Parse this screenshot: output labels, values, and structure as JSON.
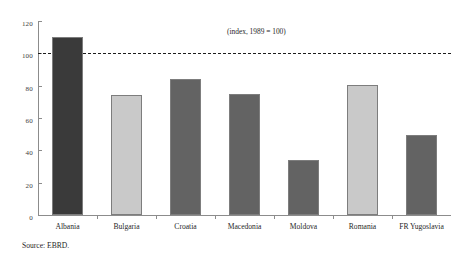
{
  "chart_data": {
    "type": "bar",
    "title": "",
    "subtitle": "",
    "annotation": "(index, 1989 = 100)",
    "xlabel": "",
    "ylabel": "",
    "ylim": [
      0,
      120
    ],
    "yticks": [
      0,
      20,
      40,
      60,
      80,
      100,
      120
    ],
    "grid": false,
    "legend": "none",
    "reference_line": {
      "value": 100,
      "style": "dashed",
      "color": "#1c1c1c"
    },
    "categories": [
      "Albania",
      "Bulgaria",
      "Croatia",
      "Macedonia",
      "Moldova",
      "Romania",
      "FR Yugoslavia"
    ],
    "values": [
      110,
      74,
      84,
      75,
      34,
      80.5,
      49.5
    ],
    "bar_colors": [
      "#3a3a3a",
      "#c9c9c9",
      "#636363",
      "#636363",
      "#636363",
      "#c9c9c9",
      "#636363"
    ],
    "bar_edge_color": "#7d7d7d",
    "axis_color": "#8c8c8c"
  },
  "footer": {
    "source": "Source: EBRD."
  }
}
